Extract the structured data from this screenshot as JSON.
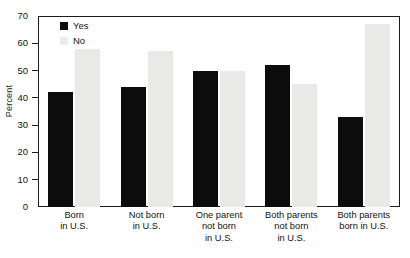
{
  "chart_data": {
    "type": "bar",
    "title": "",
    "xlabel": "",
    "ylabel": "Percent",
    "ylim": [
      0,
      70
    ],
    "ytick_values": [
      70,
      60,
      50,
      40,
      30,
      20,
      10,
      0
    ],
    "ytick_labels": [
      "70",
      "60",
      "50",
      "40",
      "30",
      "20",
      "10",
      "0"
    ],
    "grid": false,
    "legend_position": "top-left",
    "categories": [
      "Born in U.S.",
      "Not born in U.S.",
      "One parent not born in U.S.",
      "Both parents not born in U.S.",
      "Both parents born in U.S."
    ],
    "category_lines": [
      [
        "Born",
        "in U.S."
      ],
      [
        "Not born",
        "in U.S."
      ],
      [
        "One parent",
        "not born",
        "in U.S."
      ],
      [
        "Both parents",
        "not born",
        "in U.S."
      ],
      [
        "Both parents",
        "born in U.S."
      ]
    ],
    "series": [
      {
        "name": "Yes",
        "color": "#0c0c0c",
        "values": [
          42,
          44,
          50,
          52,
          33
        ]
      },
      {
        "name": "No",
        "color": "#e9e9e7",
        "values": [
          58,
          57,
          50,
          45,
          67
        ]
      }
    ]
  },
  "legend": {
    "items": [
      {
        "label": "Yes",
        "key": "yes"
      },
      {
        "label": "No",
        "key": "no"
      }
    ]
  }
}
